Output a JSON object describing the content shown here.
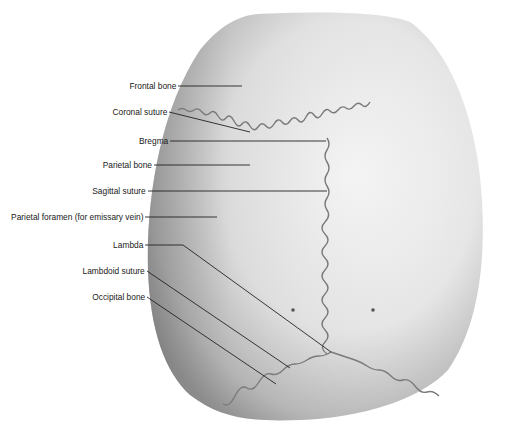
{
  "diagram": {
    "colors": {
      "bone_light": "#f4f4f4",
      "bone_mid": "#c8c8c8",
      "bone_dark": "#8a8a8a",
      "suture": "#7a7a7a",
      "leader": "#222222",
      "text": "#1a1a1a"
    },
    "labels": [
      {
        "id": "frontal-bone",
        "text": "Frontal bone",
        "right": 176,
        "y": 86,
        "line": [
          [
            178,
            86
          ],
          [
            242,
            86
          ]
        ]
      },
      {
        "id": "coronal-suture",
        "text": "Coronal suture",
        "right": 167,
        "y": 112,
        "line": [
          [
            169,
            112
          ],
          [
            250,
            132
          ]
        ]
      },
      {
        "id": "bregma",
        "text": "Bregma",
        "right": 168,
        "y": 141,
        "line": [
          [
            170,
            141
          ],
          [
            326,
            141
          ]
        ]
      },
      {
        "id": "parietal-bone",
        "text": "Parietal bone",
        "right": 152,
        "y": 165,
        "line": [
          [
            154,
            165
          ],
          [
            250,
            165
          ]
        ]
      },
      {
        "id": "sagittal-suture",
        "text": "Sagittal suture",
        "right": 146,
        "y": 191,
        "line": [
          [
            148,
            191
          ],
          [
            327,
            191
          ]
        ]
      },
      {
        "id": "parietal-foramen",
        "text": "Parietal foramen (for emissary vein)",
        "right": 143,
        "y": 217,
        "line": [
          [
            145,
            217
          ],
          [
            217,
            217
          ]
        ]
      },
      {
        "id": "lambda",
        "text": "Lambda",
        "right": 143,
        "y": 245,
        "line": [
          [
            145,
            245
          ],
          [
            183,
            245
          ],
          [
            331,
            352
          ]
        ]
      },
      {
        "id": "lambdoid-suture",
        "text": "Lambdoid suture",
        "right": 145,
        "y": 271,
        "line": [
          [
            147,
            271
          ],
          [
            290,
            368
          ]
        ]
      },
      {
        "id": "occipital-bone",
        "text": "Occipital bone",
        "right": 145,
        "y": 297,
        "line": [
          [
            147,
            297
          ],
          [
            276,
            384
          ]
        ]
      }
    ]
  }
}
